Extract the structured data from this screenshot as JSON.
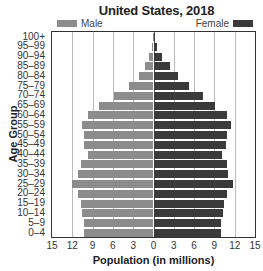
{
  "chart_data": {
    "type": "bar",
    "orientation": "horizontal",
    "subtype": "population-pyramid",
    "title": "United States, 2018",
    "xlabel": "Population (in millions)",
    "ylabel": "Age Group",
    "xlim": [
      -15,
      15
    ],
    "x_ticks": [
      15,
      12,
      9,
      6,
      3,
      0,
      3,
      6,
      9,
      12,
      15
    ],
    "grid": true,
    "legend": {
      "position": "top",
      "entries": [
        "Male",
        "Female"
      ]
    },
    "categories": [
      "100+",
      "95–99",
      "90–94",
      "85–89",
      "80–84",
      "75–79",
      "70–74",
      "65–69",
      "60–64",
      "55–59",
      "50–54",
      "45–49",
      "40–44",
      "35–39",
      "30–34",
      "25–29",
      "20–24",
      "15–19",
      "10–14",
      "5–9",
      "0–4"
    ],
    "series": [
      {
        "name": "Male",
        "color": "#8c8c8c",
        "values": [
          0.05,
          0.2,
          0.6,
          1.2,
          2.1,
          3.6,
          5.8,
          8.0,
          9.7,
          10.5,
          10.2,
          10.2,
          9.7,
          10.7,
          11.1,
          12.0,
          11.1,
          10.7,
          10.5,
          10.2,
          10.2
        ]
      },
      {
        "name": "Female",
        "color": "#3a3a3a",
        "values": [
          0.1,
          0.5,
          1.3,
          2.5,
          3.6,
          5.3,
          7.3,
          9.1,
          10.8,
          11.4,
          10.8,
          10.7,
          10.1,
          10.8,
          11.0,
          11.7,
          10.8,
          10.4,
          10.2,
          10.0,
          10.0
        ]
      }
    ]
  },
  "labels": {
    "title": "United States, 2018",
    "legend_male": "Male",
    "legend_female": "Female",
    "ylabel": "Age Group",
    "xlabel": "Population (in millions)"
  }
}
